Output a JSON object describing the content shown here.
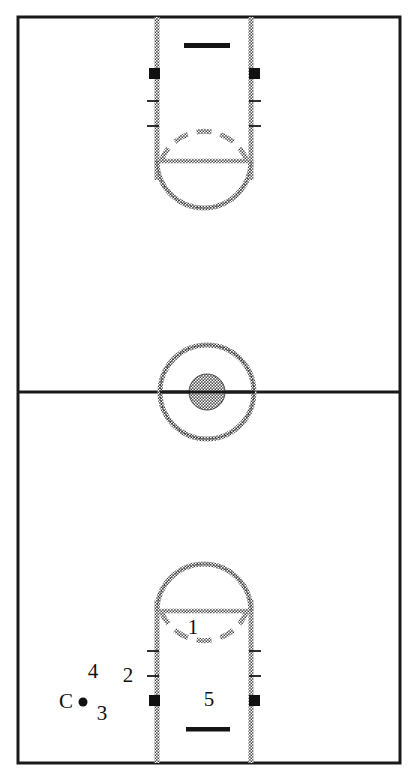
{
  "diagram": {
    "type": "basketball-court",
    "orientation": "portrait-full-court",
    "colors": {
      "court_line": "#1a1a1a",
      "painted_line": "#8a8a8a",
      "marker_fill": "#111111",
      "background": "#ffffff"
    },
    "court": {
      "boundary_label": "court-boundary",
      "midcourt_line_label": "midcourt-line"
    },
    "center_circle": {
      "outer_label": "center-circle-outer",
      "inner_label": "center-circle-inner"
    },
    "top_basket": {
      "backboard_label": "backboard",
      "lane_label": "lane",
      "free_throw_circle_label": "free-throw-circle",
      "block_labels": [
        "lane-block-left",
        "lane-block-right"
      ],
      "tick_labels": [
        "lane-tick-left-1",
        "lane-tick-left-2",
        "lane-tick-right-1",
        "lane-tick-right-2"
      ]
    },
    "bottom_basket": {
      "backboard_label": "backboard",
      "lane_label": "lane",
      "free_throw_circle_label": "free-throw-circle",
      "block_labels": [
        "lane-block-left",
        "lane-block-right"
      ],
      "tick_labels": [
        "lane-tick-left-1",
        "lane-tick-left-2",
        "lane-tick-right-1",
        "lane-tick-right-2"
      ]
    },
    "markers": [
      {
        "id": "player-1",
        "label": "1",
        "x": 193,
        "y": 629,
        "kind": "text"
      },
      {
        "id": "player-2",
        "label": "2",
        "x": 128,
        "y": 677,
        "kind": "text"
      },
      {
        "id": "player-3",
        "label": "3",
        "x": 102,
        "y": 715,
        "kind": "text"
      },
      {
        "id": "player-4",
        "label": "4",
        "x": 93,
        "y": 673,
        "kind": "text"
      },
      {
        "id": "player-5",
        "label": "5",
        "x": 209,
        "y": 701,
        "kind": "text"
      },
      {
        "id": "coach-marker",
        "label": "C",
        "x": 66,
        "y": 703,
        "kind": "text"
      }
    ],
    "ball_dot": {
      "id": "ball-dot",
      "x": 83,
      "y": 702,
      "r": 4.5
    }
  }
}
